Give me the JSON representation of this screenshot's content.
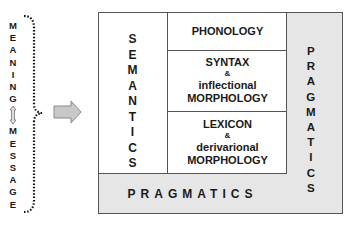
{
  "left_label": {
    "top_word": [
      "M",
      "E",
      "A",
      "N",
      "I",
      "N",
      "G"
    ],
    "separator": "⇕",
    "bottom_word": [
      "M",
      "E",
      "S",
      "S",
      "A",
      "G",
      "E"
    ]
  },
  "arrow": {
    "direction": "right",
    "color": "#c8c8c8"
  },
  "diagram": {
    "semantics": [
      "S",
      "E",
      "M",
      "A",
      "N",
      "T",
      "I",
      "C",
      "S"
    ],
    "phonology": "PHONOLOGY",
    "syntax": {
      "title": "SYNTAX",
      "amp": "&",
      "line2": "inflectional",
      "line3": "MORPHOLOGY"
    },
    "lexicon": {
      "title": "LEXICON",
      "amp": "&",
      "line2": "derivarional",
      "line3": "MORPHOLOGY"
    },
    "pragmatics_right": [
      "P",
      "R",
      "A",
      "G",
      "M",
      "A",
      "T",
      "I",
      "C",
      "S"
    ],
    "pragmatics_bottom": "PRAGMATICS"
  },
  "colors": {
    "outer_fill": "#e6e6e6",
    "inner_fill": "#ffffff",
    "border": "#555555"
  }
}
